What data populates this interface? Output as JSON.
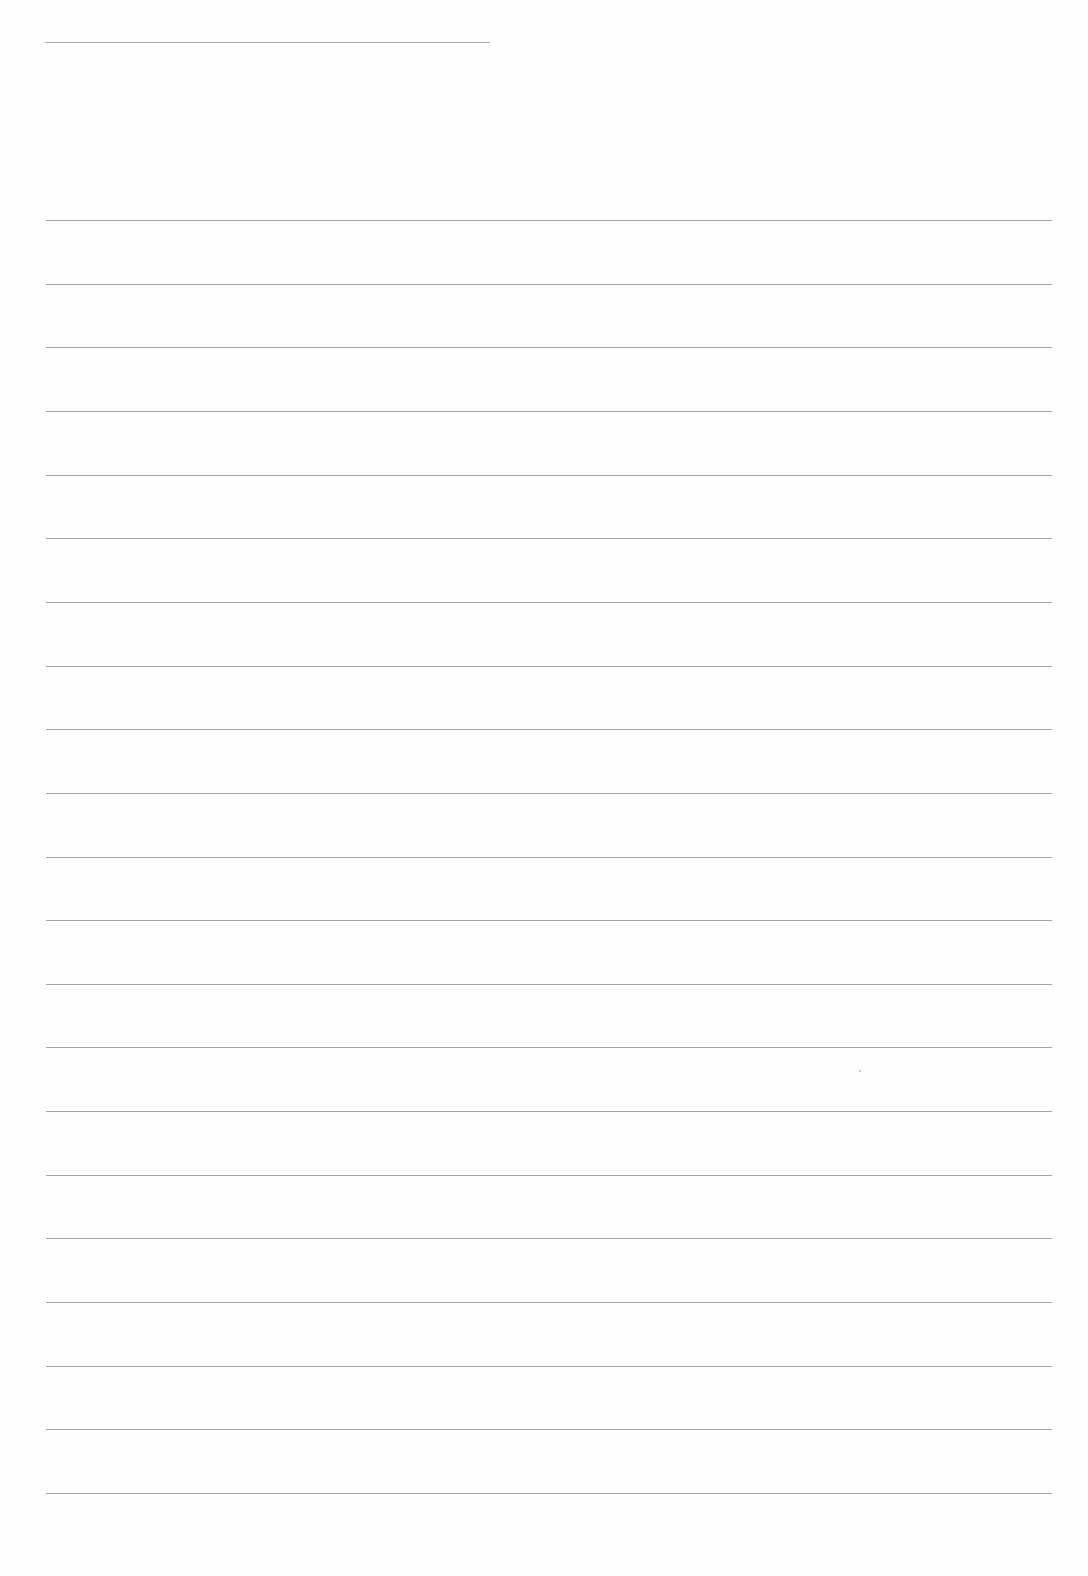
{
  "page": {
    "type": "lined-paper",
    "background_color": "#fefefe",
    "line_color": "#8e8e8e",
    "header_line": {
      "x_start": 45,
      "x_end": 490,
      "y": 42
    },
    "rule_lines": {
      "x_start": 46,
      "x_end": 1052,
      "first_y": 220,
      "spacing": 63.65,
      "count": 21
    },
    "text_content": []
  }
}
